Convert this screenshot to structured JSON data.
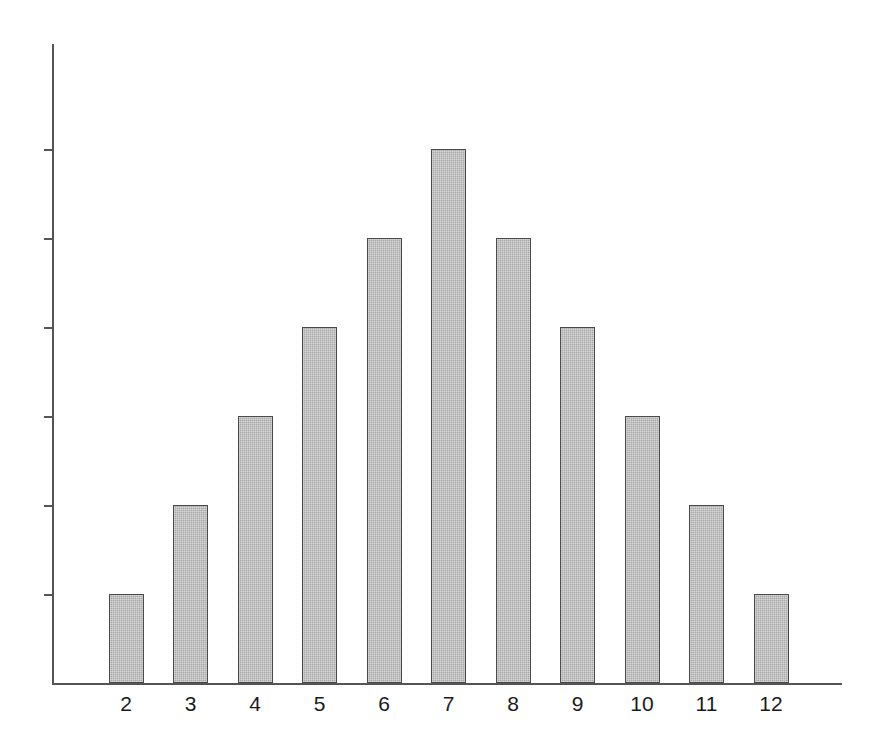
{
  "chart_data": {
    "type": "bar",
    "title": "",
    "subtitle": "",
    "xlabel": "",
    "ylabel": "",
    "categories": [
      "2",
      "3",
      "4",
      "5",
      "6",
      "7",
      "8",
      "9",
      "10",
      "11",
      "12"
    ],
    "values": [
      1,
      2,
      3,
      4,
      5,
      6,
      5,
      4,
      3,
      2,
      1
    ],
    "ylim": [
      0,
      7
    ],
    "y_tick_values": [
      1,
      2,
      3,
      4,
      5,
      6
    ],
    "y_tick_labels": [
      "",
      "",
      "",
      "",
      "",
      ""
    ],
    "grid": false,
    "legend": null,
    "legend_position": "none",
    "annotations": [],
    "series": [
      {
        "name": "frequency",
        "values": [
          1,
          2,
          3,
          4,
          5,
          6,
          5,
          4,
          3,
          2,
          1
        ]
      }
    ],
    "style": {
      "bar_fill": "#a9a9a9",
      "bar_edge": "#4a4a4a",
      "axis_color": "#555555",
      "background": "#ffffff",
      "bar_fill_pattern": "dithered-halftone-gray"
    }
  },
  "axis": {
    "y_axis_name": "y-axis",
    "x_axis_name": "x-axis"
  }
}
